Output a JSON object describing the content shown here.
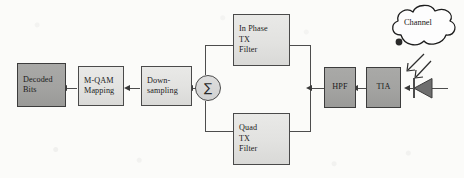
{
  "diagram": {
    "background_color": "#fbfbf9",
    "line_color": "#4d4d4d",
    "fill_light": "#e4e4e2",
    "fill_dark": "#a5a5a3",
    "blocks": [
      {
        "id": "decoded-bits",
        "lines": [
          "Decoded",
          "Bits"
        ],
        "shade": "dark"
      },
      {
        "id": "m-qam-mapping",
        "lines": [
          "M-QAM",
          "Mapping"
        ],
        "shade": "light"
      },
      {
        "id": "down-sampling",
        "lines": [
          "Down-",
          "sampling"
        ],
        "shade": "light"
      },
      {
        "id": "in-phase-tx-filter",
        "lines": [
          "In Phase",
          "TX",
          "Filter"
        ],
        "shade": "light"
      },
      {
        "id": "quad-tx-filter",
        "lines": [
          "Quad",
          "TX",
          "Filter"
        ],
        "shade": "light"
      },
      {
        "id": "hpf",
        "lines": [
          "HPF"
        ],
        "shade": "dark"
      },
      {
        "id": "tia",
        "lines": [
          "TIA"
        ],
        "shade": "dark"
      }
    ],
    "summing_junction": {
      "symbol": "∑",
      "name": "summation"
    },
    "channel": {
      "label": "Channel",
      "shape": "cloud"
    },
    "photodiode": {
      "name": "photodiode",
      "symbol": "triangle-with-bar"
    },
    "optical_arrows": {
      "count": 2,
      "direction": "down-left"
    }
  }
}
